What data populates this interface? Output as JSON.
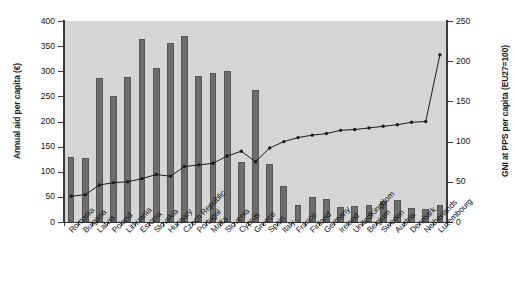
{
  "chart_data": {
    "type": "bar",
    "title": "",
    "xlabel": "",
    "ylabel": "Annual aid per capita (€)",
    "y2label": "GNI at PPS per capita (EU27=100)",
    "ylim": [
      0,
      400
    ],
    "y2lim": [
      0,
      250
    ],
    "yticks": [
      "0",
      "50",
      "100",
      "150",
      "200",
      "250",
      "300",
      "350",
      "400"
    ],
    "y2ticks": [
      "0",
      "50",
      "100",
      "150",
      "200",
      "250"
    ],
    "grid": false,
    "legend": "none",
    "plot_background": "#d5d5d5",
    "bar_color": "#6d6d6d",
    "line_color": "#1a1a1a",
    "categories": [
      "Romania",
      "Bulgaria",
      "Latvia",
      "Poland",
      "Lithuania",
      "Estonia",
      "Slovakia",
      "Hungary",
      "Czech Republic",
      "Portugal",
      "Malta",
      "Slovenia",
      "Cyprus",
      "Greece",
      "Spain",
      "Italy",
      "France",
      "Finland",
      "Germany",
      "Ireland",
      "UnitedKingdom",
      "Belgium",
      "Sweden",
      "Austria",
      "Denmark",
      "Netherlands",
      "Luxembourg"
    ],
    "series": [
      {
        "name": "Annual aid per capita (€)",
        "type": "bar",
        "axis": "left",
        "values": [
          130,
          127,
          287,
          251,
          288,
          364,
          307,
          357,
          370,
          291,
          296,
          300,
          119,
          262,
          115,
          72,
          34,
          49,
          46,
          30,
          31,
          34,
          41,
          44,
          27,
          25,
          34
        ]
      },
      {
        "name": "GNI at PPS per capita (EU27=100)",
        "type": "line",
        "axis": "right",
        "values": [
          32,
          34,
          46,
          49,
          50,
          54,
          59,
          57,
          69,
          71,
          73,
          82,
          88,
          75,
          92,
          100,
          105,
          108,
          110,
          114,
          115,
          117,
          119,
          121,
          124,
          125,
          208
        ]
      }
    ]
  }
}
